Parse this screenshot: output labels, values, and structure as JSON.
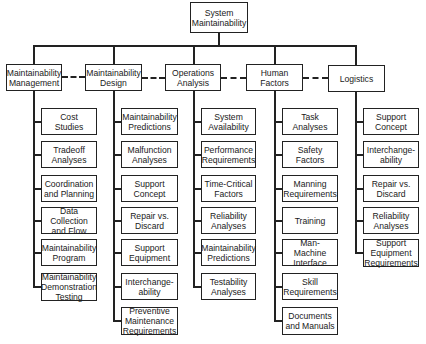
{
  "diagram": {
    "root": {
      "label": "System\nMaintainability"
    },
    "categories": [
      {
        "label": "Maintainability\nManagement",
        "children": [
          "Cost\nStudies",
          "Tradeoff\nAnalyses",
          "Coordination\nand Planning",
          "Data\nCollection\nand Flow",
          "Maintainability\nProgram",
          "Maintainability\nDemonstration\nTesting"
        ]
      },
      {
        "label": "Maintainability\nDesign",
        "children": [
          "Maintainability\nPredictions",
          "Malfunction\nAnalyses",
          "Support\nConcept",
          "Repair vs.\nDiscard",
          "Support\nEquipment",
          "Interchange-\nability",
          "Preventive\nMaintenance\nRequirements"
        ]
      },
      {
        "label": "Operations\nAnalysis",
        "children": [
          "System\nAvailability",
          "Performance\nRequirements",
          "Time-Critical\nFactors",
          "Reliability\nAnalyses",
          "Maintainability\nPredictions",
          "Testability\nAnalyses"
        ]
      },
      {
        "label": "Human\nFactors",
        "children": [
          "Task\nAnalyses",
          "Safety\nFactors",
          "Manning\nRequirements",
          "Training",
          "Man-Machine\nInterface",
          "Skill\nRequirements",
          "Documents\nand Manuals"
        ]
      },
      {
        "label": "Logistics",
        "children": [
          "Support\nConcept",
          "Interchange-\nability",
          "Repair vs.\nDiscard",
          "Reliability\nAnalyses",
          "Support\nEquipment\nRequirements"
        ]
      }
    ],
    "colors": {
      "line": "#222222",
      "box_fill": "#ffffff",
      "text": "#1a1a1a"
    }
  }
}
